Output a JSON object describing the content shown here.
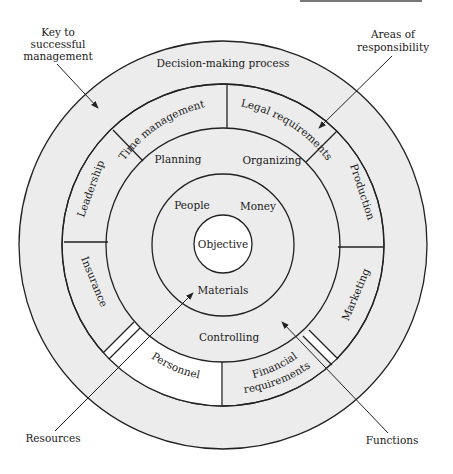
{
  "diagram": {
    "center": {
      "x": 223,
      "y": 245
    },
    "radii": {
      "objective": 29,
      "resources": 71,
      "functions": 117,
      "areas": 161,
      "keys": 204
    },
    "colors": {
      "fill": "#ececec",
      "white": "#ffffff",
      "stroke": "#222222"
    },
    "objective": "Objective",
    "resources": [
      "People",
      "Money",
      "Materials"
    ],
    "functions": [
      "Planning",
      "Organizing",
      "Controlling"
    ],
    "areas_of_responsibility": [
      "Time management",
      "Legal requirements",
      "Production",
      "Marketing",
      "Financial requirements",
      "Personnel",
      "Insurance",
      "Leadership"
    ],
    "financial_line1": "Financial",
    "financial_line2": "requirements",
    "key_to_success": "Decision-making process",
    "annotations": {
      "key_label_1": "Key to",
      "key_label_2": "successful",
      "key_label_3": "management",
      "areas_label_1": "Areas of",
      "areas_label_2": "responsibility",
      "resources_label": "Resources",
      "functions_label": "Functions"
    }
  }
}
